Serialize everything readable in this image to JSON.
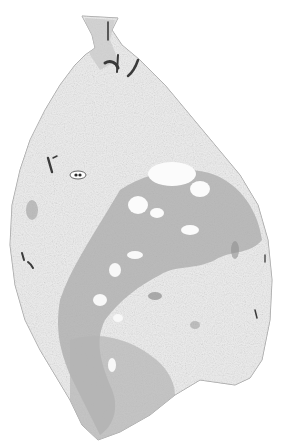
{
  "image": {
    "subject": "histology tissue section",
    "width": 283,
    "height": 447,
    "background": "#ffffff",
    "colors": {
      "tissue_light": "#f1f1f1",
      "tissue_mid": "#d6d6d6",
      "dense_region": "#a9a9a9",
      "dark_vessel": "#3a3a3a",
      "edge": "#9a9a9a"
    }
  }
}
